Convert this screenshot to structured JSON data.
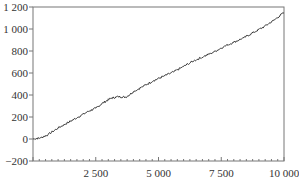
{
  "chart_data": {
    "type": "line",
    "title": "",
    "xlabel": "",
    "ylabel": "",
    "xlim": [
      0,
      10000
    ],
    "ylim": [
      -200,
      1200
    ],
    "grid": false,
    "legend": null,
    "x_ticks": [
      2500,
      5000,
      7500,
      10000
    ],
    "x_tick_labels": [
      "2 500",
      "5 000",
      "7 500",
      "10 000"
    ],
    "y_ticks": [
      -200,
      0,
      200,
      400,
      600,
      800,
      1000,
      1200
    ],
    "y_tick_labels": [
      "−200",
      "0",
      "200",
      "400",
      "600",
      "800",
      "1 000",
      "1 200"
    ],
    "series": [
      {
        "name": "series",
        "color": "#333333",
        "x": [
          0,
          300,
          600,
          1000,
          1400,
          1800,
          2200,
          2500,
          2800,
          3100,
          3400,
          3700,
          4000,
          4400,
          4800,
          5200,
          5600,
          6000,
          6400,
          6800,
          7200,
          7600,
          8000,
          8400,
          8800,
          9200,
          9600,
          10000
        ],
        "values": [
          0,
          10,
          40,
          100,
          150,
          200,
          250,
          280,
          330,
          370,
          385,
          380,
          430,
          480,
          530,
          570,
          610,
          660,
          710,
          750,
          790,
          840,
          880,
          920,
          970,
          1020,
          1080,
          1150
        ]
      }
    ]
  }
}
